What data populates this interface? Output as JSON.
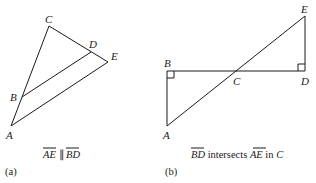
{
  "figure_a": {
    "tag": "(a)",
    "caption": {
      "seg1": "AE",
      "relation": "∥",
      "seg2": "BD"
    },
    "points": {
      "A": {
        "label": "A",
        "x": 11,
        "y": 126
      },
      "B": {
        "label": "B",
        "x": 22,
        "y": 97
      },
      "C": {
        "label": "C",
        "x": 49,
        "y": 26
      },
      "D": {
        "label": "D",
        "x": 91,
        "y": 52
      },
      "E": {
        "label": "E",
        "x": 108,
        "y": 62
      }
    }
  },
  "figure_b": {
    "tag": "(b)",
    "caption": {
      "seg1": "BD",
      "text1": " intersects ",
      "seg2": "AE",
      "text2": " in ",
      "point": "C"
    },
    "points": {
      "A": {
        "label": "A",
        "x": 167,
        "y": 126
      },
      "B": {
        "label": "B",
        "x": 167,
        "y": 71
      },
      "C": {
        "label": "C",
        "x": 237,
        "y": 71
      },
      "D": {
        "label": "D",
        "x": 305,
        "y": 71
      },
      "E": {
        "label": "E",
        "x": 305,
        "y": 16
      }
    },
    "right_angles": [
      "B",
      "D"
    ]
  },
  "colors": {
    "line": "#1a1a1a",
    "background": "#ffffff"
  }
}
